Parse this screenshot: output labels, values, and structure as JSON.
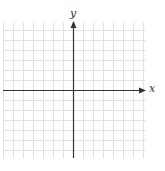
{
  "diagram": {
    "type": "coordinate-plane",
    "axes": {
      "x_label": "x",
      "y_label": "y"
    },
    "grid": {
      "left": 3,
      "top": 22,
      "right": 145,
      "bottom": 158,
      "spacing": 10,
      "origin_x": 73,
      "origin_y": 90
    },
    "colors": {
      "grid": "#e2e2e2",
      "axis": "#333333",
      "background": "#ffffff"
    }
  }
}
